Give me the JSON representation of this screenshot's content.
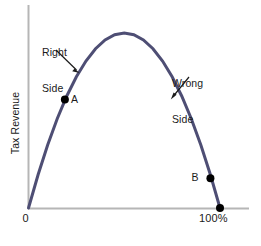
{
  "figure": {
    "kind": "laffer-curve-diagram",
    "background_color": "#ffffff"
  },
  "chart_data": {
    "type": "line",
    "title": "",
    "subtitle": "",
    "xlabel": "",
    "ylabel": "Tax Revenue",
    "xlim": [
      0,
      100
    ],
    "ylim": [
      0,
      100
    ],
    "grid": false,
    "legend": "none",
    "curve_name": "Laffer curve",
    "curve_color": "#4e4e74",
    "curve_width_px": 3,
    "x_tick_labels": [
      "0",
      "100%"
    ],
    "y_tick_labels": [],
    "x": [
      0,
      5,
      10,
      15,
      20,
      25,
      30,
      35,
      40,
      45,
      50,
      55,
      60,
      65,
      70,
      75,
      80,
      85,
      90,
      95,
      100
    ],
    "values": [
      0,
      19,
      36,
      51,
      64,
      75,
      84,
      91,
      96,
      99,
      100,
      99,
      96,
      91,
      84,
      75,
      64,
      51,
      36,
      19,
      0
    ],
    "peak": {
      "x": 50,
      "y": 100
    },
    "points": [
      {
        "label": "A",
        "x": 19,
        "y": 62,
        "marker": "filled-circle",
        "color": "#000000",
        "label_side": "right"
      },
      {
        "label": "B",
        "x": 95,
        "y": 17,
        "marker": "filled-circle",
        "color": "#000000",
        "label_side": "left"
      },
      {
        "label": "",
        "x": 100,
        "y": 0,
        "marker": "filled-circle",
        "color": "#000000",
        "label_side": "none"
      }
    ],
    "annotations": [
      {
        "text": "Right\nSide",
        "line1": "Right",
        "line2": "Side",
        "target_x": 22,
        "target_y": 70,
        "arrow": "down-right"
      },
      {
        "text": "Wrong\nSide",
        "line1": "Wrong",
        "line2": "Side",
        "target_x": 72,
        "target_y": 58,
        "arrow": "down-left"
      }
    ],
    "axis_color": "#b6b6b6",
    "label_color": "#1b1b1b"
  },
  "labels": {
    "y_axis": "Tax Revenue",
    "x_origin": "0",
    "x_max": "100%",
    "right_side_line1": "Right",
    "right_side_line2": "Side",
    "wrong_side_line1": "Wrong",
    "wrong_side_line2": "Side",
    "point_a": "A",
    "point_b": "B"
  }
}
